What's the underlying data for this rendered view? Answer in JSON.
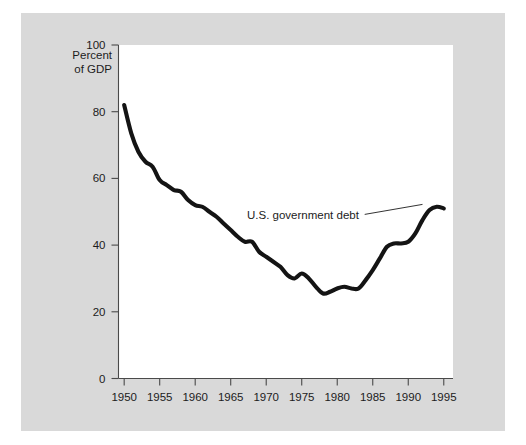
{
  "figure": {
    "panel_background": "#d9d9d9",
    "plot_background": "#ffffff",
    "axis_color": "#4a4a4a",
    "series_color": "#141414"
  },
  "axis_title": {
    "line1": "Percent",
    "line2": "of GDP"
  },
  "annotation": {
    "label": "U.S. government debt"
  },
  "chart_data": {
    "type": "line",
    "title": "",
    "subtitle": "",
    "xlabel": "",
    "ylabel": "Percent of GDP",
    "xlim": [
      1949,
      1996
    ],
    "ylim": [
      0,
      100
    ],
    "grid": false,
    "legend_position": "none",
    "xticks": [
      1950,
      1955,
      1960,
      1965,
      1970,
      1975,
      1980,
      1985,
      1990,
      1995
    ],
    "xtick_labels": [
      "1950",
      "1955",
      "1960",
      "1965",
      "1970",
      "1975",
      "1980",
      "1985",
      "1990",
      "1995"
    ],
    "yticks": [
      0,
      20,
      40,
      60,
      80,
      100
    ],
    "ytick_labels": [
      "0",
      "20",
      "40",
      "60",
      "80",
      "100"
    ],
    "annotations": [
      {
        "text": "U.S. government debt",
        "x": 1975,
        "y": 57,
        "points_to_x": 1992,
        "points_to_y": 51
      }
    ],
    "series": [
      {
        "name": "U.S. government debt",
        "color": "#141414",
        "x": [
          1950,
          1951,
          1952,
          1953,
          1954,
          1955,
          1956,
          1957,
          1958,
          1959,
          1960,
          1961,
          1962,
          1963,
          1964,
          1965,
          1966,
          1967,
          1968,
          1969,
          1970,
          1971,
          1972,
          1973,
          1974,
          1975,
          1976,
          1977,
          1978,
          1979,
          1980,
          1981,
          1982,
          1983,
          1984,
          1985,
          1986,
          1987,
          1988,
          1989,
          1990,
          1991,
          1992,
          1993,
          1994,
          1995
        ],
        "values": [
          82.0,
          73.5,
          68.0,
          65.0,
          63.5,
          59.5,
          58.0,
          56.5,
          56.0,
          53.5,
          52.0,
          51.5,
          50.0,
          48.5,
          46.5,
          44.5,
          42.5,
          41.0,
          41.0,
          38.0,
          36.5,
          35.0,
          33.5,
          31.0,
          30.0,
          31.5,
          30.0,
          27.5,
          25.5,
          26.0,
          27.0,
          27.5,
          27.0,
          27.0,
          29.5,
          32.5,
          36.0,
          39.5,
          40.5,
          40.5,
          41.0,
          43.5,
          47.5,
          50.5,
          51.5,
          51.0
        ]
      }
    ]
  }
}
